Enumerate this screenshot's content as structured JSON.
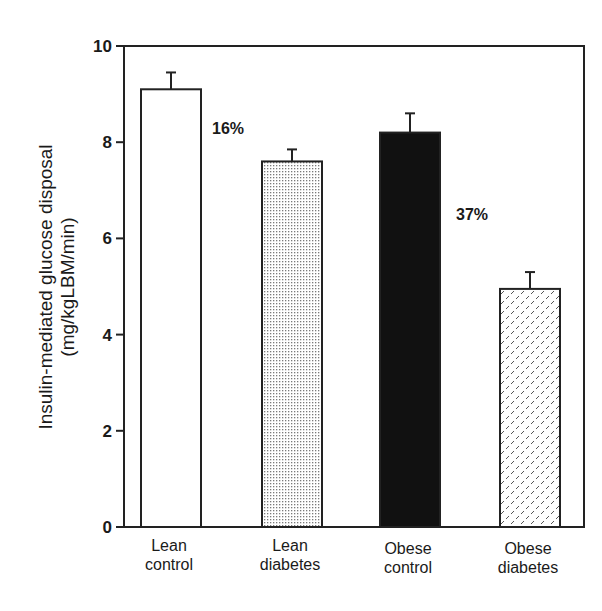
{
  "chart_data": {
    "type": "bar",
    "title": "",
    "xlabel": "",
    "ylabel": "Insulin-mediated glucose disposal (mg/kgLBM/min)",
    "ylabel_lines": [
      "Insulin-mediated glucose disposal",
      "(mg/kgLBM/min)"
    ],
    "categories": [
      "Lean control",
      "Lean diabetes",
      "Obese control",
      "Obese diabetes"
    ],
    "category_lines": [
      [
        "Lean",
        "control"
      ],
      [
        "Lean",
        "diabetes"
      ],
      [
        "Obese",
        "control"
      ],
      [
        "Obese",
        "diabetes"
      ]
    ],
    "values": [
      9.1,
      7.6,
      8.2,
      4.95
    ],
    "error_upper": [
      0.35,
      0.25,
      0.4,
      0.35
    ],
    "fills": [
      "white",
      "fine-dots",
      "black",
      "dashes"
    ],
    "ylim": [
      0,
      10
    ],
    "yticks": [
      0,
      2,
      4,
      6,
      8,
      10
    ],
    "grid": false,
    "legend": null,
    "annotations": [
      {
        "text": "16%",
        "between": [
          "Lean control",
          "Lean diabetes"
        ],
        "y": 8.3
      },
      {
        "text": "37%",
        "between": [
          "Obese control",
          "Obese diabetes"
        ],
        "y": 6.5
      }
    ]
  }
}
